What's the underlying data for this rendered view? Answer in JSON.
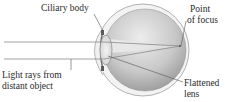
{
  "diagram": {
    "labels": {
      "ciliary_body": "Ciliary body",
      "point_of_focus_line1": "Point",
      "point_of_focus_line2": "of focus",
      "light_rays_line1": "Light rays from",
      "light_rays_line2": "distant object",
      "flattened_lens_line1": "Flattened",
      "flattened_lens_line2": "lens"
    },
    "colors": {
      "ray": "#8a8a8a",
      "sclera_outline": "#9a9a9a",
      "eyeball_light": "#e6e6e6",
      "eyeball_dark": "#9c9c9c",
      "leader_line": "#555555",
      "text": "#2a2a2a"
    }
  }
}
